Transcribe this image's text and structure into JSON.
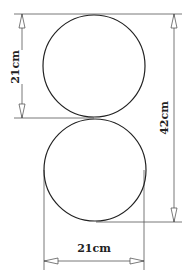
{
  "diagram": {
    "shapes": [
      {
        "type": "circle",
        "name": "top-circle",
        "diameter_cm": 21
      },
      {
        "type": "circle",
        "name": "bottom-circle",
        "diameter_cm": 21
      }
    ],
    "dimensions": {
      "left_vertical": {
        "label": "21cm",
        "measures": "diameter of top circle"
      },
      "right_vertical": {
        "label": "42cm",
        "measures": "total height of both circles"
      },
      "bottom_horizontal": {
        "label": "21cm",
        "measures": "diameter of bottom circle"
      }
    },
    "colors": {
      "line": "#222222",
      "dimension": "#555555",
      "background": "#ffffff"
    }
  }
}
